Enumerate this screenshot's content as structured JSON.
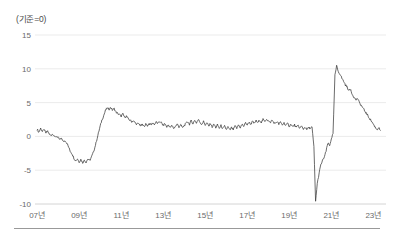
{
  "chart_data": {
    "type": "line",
    "title": "",
    "subtitle": "",
    "unit_label": "(기준=0)",
    "xlabel": "",
    "ylabel": "",
    "ylim": [
      -10,
      15
    ],
    "xlim": [
      2006.9,
      2023.6
    ],
    "grid": true,
    "legend": null,
    "yticks": [
      15,
      10,
      5,
      0,
      -5,
      -10
    ],
    "ytick_labels": [
      "15",
      "10",
      "5",
      "0",
      "-5",
      "-10"
    ],
    "xticks": [
      2007,
      2009,
      2011,
      2013,
      2015,
      2017,
      2019,
      2021,
      2023
    ],
    "xtick_labels": [
      "07년",
      "09년",
      "11년",
      "13년",
      "15년",
      "17년",
      "19년",
      "21년",
      "23년"
    ],
    "line_color": "#3a3a3a",
    "grid_color": "#e2e2e2",
    "series": [
      {
        "name": "index",
        "x": [
          2007.0,
          2007.08,
          2007.17,
          2007.25,
          2007.33,
          2007.42,
          2007.5,
          2007.58,
          2007.67,
          2007.75,
          2007.83,
          2007.92,
          2008.0,
          2008.08,
          2008.17,
          2008.25,
          2008.33,
          2008.42,
          2008.5,
          2008.58,
          2008.67,
          2008.75,
          2008.83,
          2008.92,
          2009.0,
          2009.08,
          2009.17,
          2009.25,
          2009.33,
          2009.42,
          2009.5,
          2009.58,
          2009.67,
          2009.75,
          2009.83,
          2009.92,
          2010.0,
          2010.08,
          2010.17,
          2010.25,
          2010.33,
          2010.42,
          2010.5,
          2010.58,
          2010.67,
          2010.75,
          2010.83,
          2010.92,
          2011.0,
          2011.08,
          2011.17,
          2011.25,
          2011.33,
          2011.42,
          2011.5,
          2011.58,
          2011.67,
          2011.75,
          2011.83,
          2011.92,
          2012.0,
          2012.08,
          2012.17,
          2012.25,
          2012.33,
          2012.42,
          2012.5,
          2012.58,
          2012.67,
          2012.75,
          2012.83,
          2012.92,
          2013.0,
          2013.08,
          2013.17,
          2013.25,
          2013.33,
          2013.42,
          2013.5,
          2013.58,
          2013.67,
          2013.75,
          2013.83,
          2013.92,
          2014.0,
          2014.08,
          2014.17,
          2014.25,
          2014.33,
          2014.42,
          2014.5,
          2014.58,
          2014.67,
          2014.75,
          2014.83,
          2014.92,
          2015.0,
          2015.08,
          2015.17,
          2015.25,
          2015.33,
          2015.42,
          2015.5,
          2015.58,
          2015.67,
          2015.75,
          2015.83,
          2015.92,
          2016.0,
          2016.08,
          2016.17,
          2016.25,
          2016.33,
          2016.42,
          2016.5,
          2016.58,
          2016.67,
          2016.75,
          2016.83,
          2016.92,
          2017.0,
          2017.08,
          2017.17,
          2017.25,
          2017.33,
          2017.42,
          2017.5,
          2017.58,
          2017.67,
          2017.75,
          2017.83,
          2017.92,
          2018.0,
          2018.08,
          2018.17,
          2018.25,
          2018.33,
          2018.42,
          2018.5,
          2018.58,
          2018.67,
          2018.75,
          2018.83,
          2018.92,
          2019.0,
          2019.08,
          2019.17,
          2019.25,
          2019.33,
          2019.42,
          2019.5,
          2019.58,
          2019.67,
          2019.75,
          2019.83,
          2019.92,
          2020.0,
          2020.08,
          2020.17,
          2020.25,
          2020.33,
          2020.42,
          2020.5,
          2020.58,
          2020.67,
          2020.75,
          2020.83,
          2020.92,
          2021.0,
          2021.08,
          2021.17,
          2021.25,
          2021.33,
          2021.42,
          2021.5,
          2021.58,
          2021.67,
          2021.75,
          2021.83,
          2021.92,
          2022.0,
          2022.08,
          2022.17,
          2022.25,
          2022.33,
          2022.42,
          2022.5,
          2022.58,
          2022.67,
          2022.75,
          2022.83,
          2022.92,
          2023.0,
          2023.08,
          2023.17,
          2023.25,
          2023.33
        ],
        "values": [
          1.1,
          0.6,
          1.2,
          0.7,
          1.0,
          0.5,
          0.8,
          0.3,
          0.2,
          0.4,
          -0.1,
          0.0,
          -0.2,
          -0.5,
          -0.3,
          -0.8,
          -0.6,
          -1.0,
          -1.6,
          -2.2,
          -2.6,
          -3.2,
          -3.6,
          -3.3,
          -3.8,
          -3.4,
          -3.9,
          -3.5,
          -3.8,
          -3.3,
          -3.6,
          -3.1,
          -2.4,
          -1.6,
          -0.6,
          0.5,
          1.5,
          2.4,
          3.1,
          3.8,
          4.2,
          4.0,
          4.3,
          3.9,
          4.1,
          3.6,
          3.4,
          3.2,
          3.0,
          3.3,
          2.8,
          3.0,
          2.6,
          2.4,
          2.2,
          2.3,
          2.0,
          1.8,
          1.9,
          1.6,
          1.7,
          1.5,
          1.8,
          1.6,
          1.9,
          1.7,
          2.0,
          1.8,
          2.1,
          1.9,
          2.2,
          2.0,
          1.6,
          1.9,
          1.4,
          1.7,
          1.3,
          1.6,
          1.2,
          1.5,
          1.8,
          1.4,
          1.7,
          1.3,
          1.6,
          1.9,
          2.2,
          1.8,
          2.3,
          1.9,
          2.4,
          2.0,
          2.5,
          2.1,
          1.8,
          2.2,
          1.7,
          2.0,
          1.5,
          1.9,
          1.4,
          1.8,
          1.3,
          1.7,
          1.2,
          1.6,
          1.1,
          1.5,
          1.0,
          1.4,
          0.9,
          1.3,
          1.0,
          1.5,
          1.2,
          1.7,
          1.3,
          1.8,
          1.5,
          2.0,
          1.7,
          2.1,
          1.8,
          2.2,
          1.9,
          2.3,
          2.0,
          2.4,
          2.1,
          2.5,
          2.2,
          2.6,
          2.3,
          2.0,
          2.4,
          2.1,
          1.9,
          2.2,
          1.8,
          2.1,
          1.7,
          2.0,
          1.6,
          1.9,
          1.5,
          1.8,
          1.4,
          1.7,
          1.3,
          1.6,
          1.2,
          1.5,
          1.1,
          1.4,
          1.0,
          1.3,
          1.2,
          1.4,
          -1.5,
          -9.6,
          -7.0,
          -5.4,
          -4.2,
          -3.6,
          -3.0,
          -2.2,
          -1.0,
          -1.4,
          -0.3,
          0.4,
          9.0,
          10.4,
          9.6,
          9.2,
          8.6,
          8.2,
          7.6,
          7.3,
          6.8,
          6.9,
          6.2,
          5.8,
          5.4,
          5.6,
          5.0,
          4.6,
          4.2,
          3.8,
          3.4,
          3.0,
          2.6,
          2.2,
          1.8,
          1.4,
          1.0,
          1.3,
          0.9
        ]
      }
    ]
  },
  "axes": {
    "plot_left": 35,
    "plot_right": 386,
    "plot_top": 35,
    "plot_bottom": 204
  }
}
